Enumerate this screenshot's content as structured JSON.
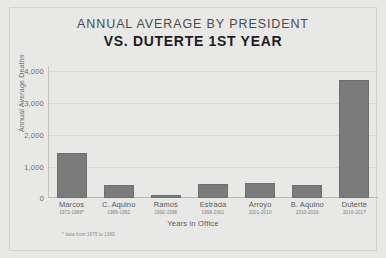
{
  "titles": {
    "main": "ANNUAL AVERAGE BY PRESIDENT",
    "sub": "VS. DUTERTE 1ST YEAR"
  },
  "footnote": "* data from 1975 to 1985",
  "colors": {
    "background": "#e8e8e6",
    "bar": "#7b7b7b",
    "grid": "#d9d9d5",
    "text": "#5a5a5a"
  },
  "chart_data": {
    "type": "bar",
    "title": "ANNUAL AVERAGE BY PRESIDENT VS. DUTERTE 1ST YEAR",
    "xlabel": "Years in Office",
    "ylabel": "Annual Average Deaths",
    "ylim": [
      0,
      4000
    ],
    "yticks": [
      "0",
      "1,000",
      "2,000",
      "3,000",
      "4,000"
    ],
    "ytick_values": [
      0,
      1000,
      2000,
      3000,
      4000
    ],
    "grid": true,
    "legend": "none",
    "categories": [
      "Marcos",
      "C. Aquino",
      "Ramos",
      "Estrada",
      "Arroyo",
      "B. Aquino",
      "Duterte"
    ],
    "category_years": [
      "1972-1986*",
      "1986-1992",
      "1992-1998",
      "1998-2001",
      "2001-2010",
      "2010-2016",
      "2016-2017"
    ],
    "values": [
      1350,
      380,
      95,
      410,
      470,
      390,
      3570
    ],
    "annotation": "* data from 1975 to 1985"
  }
}
